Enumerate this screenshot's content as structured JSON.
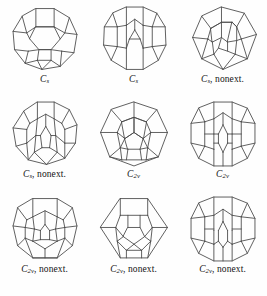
{
  "figure": {
    "background_color": "#fefefe",
    "stroke_color": "#4a4a4a",
    "text_color": "#141414",
    "columns": 3,
    "rows": 3
  },
  "items": [
    {
      "id": "graph-1",
      "caption_symbol": "C",
      "caption_subscript": "s",
      "caption_note": "",
      "caption_full": "C s",
      "point_group": "Cs",
      "nonextendable": false,
      "outline_sides": 11
    },
    {
      "id": "graph-2",
      "caption_symbol": "C",
      "caption_subscript": "s",
      "caption_note": "",
      "caption_full": "C s",
      "point_group": "Cs",
      "nonextendable": false,
      "outline_sides": 12
    },
    {
      "id": "graph-3",
      "caption_symbol": "C",
      "caption_subscript": "s",
      "caption_note": ", nonext.",
      "caption_full": "C s, nonext.",
      "point_group": "Cs",
      "nonextendable": true,
      "outline_sides": 8
    },
    {
      "id": "graph-4",
      "caption_symbol": "C",
      "caption_subscript": "s",
      "caption_note": ", nonext.",
      "caption_full": "C s, nonext.",
      "point_group": "Cs",
      "nonextendable": true,
      "outline_sides": 11
    },
    {
      "id": "graph-5",
      "caption_symbol": "C",
      "caption_subscript": "2v",
      "caption_note": "",
      "caption_full": "C 2v",
      "point_group": "C2v",
      "nonextendable": false,
      "outline_sides": 9
    },
    {
      "id": "graph-6",
      "caption_symbol": "C",
      "caption_subscript": "2v",
      "caption_note": "",
      "caption_full": "C 2v",
      "point_group": "C2v",
      "nonextendable": false,
      "outline_sides": 12
    },
    {
      "id": "graph-7",
      "caption_symbol": "C",
      "caption_subscript": "2v",
      "caption_note": ", nonext.",
      "caption_full": "C 2v, nonext.",
      "point_group": "C2v",
      "nonextendable": true,
      "outline_sides": 10
    },
    {
      "id": "graph-8",
      "caption_symbol": "C",
      "caption_subscript": "2v",
      "caption_note": ", nonext.",
      "caption_full": "C 2v, nonext.",
      "point_group": "C2v",
      "nonextendable": true,
      "outline_sides": 8
    },
    {
      "id": "graph-9",
      "caption_symbol": "C",
      "caption_subscript": "2v",
      "caption_note": ", nonext.",
      "caption_full": "C 2v, nonext.",
      "point_group": "C2v",
      "nonextendable": true,
      "outline_sides": 12
    }
  ]
}
